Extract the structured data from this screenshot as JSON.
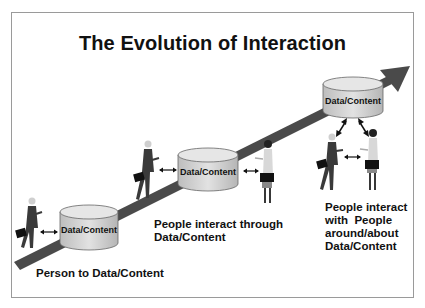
{
  "slide": {
    "title": "The Evolution of Interaction",
    "stages": [
      {
        "cylinder_label": "Data/Content",
        "caption_lines": [
          "Person to Data/Content"
        ]
      },
      {
        "cylinder_label": "Data/Content",
        "caption_lines": [
          "People interact through",
          "Data/Content"
        ]
      },
      {
        "cylinder_label": "Data/Content",
        "caption_lines": [
          "People interact",
          "with  People",
          "around/about",
          "Data/Content"
        ]
      }
    ],
    "icons": [
      "rising-arrow-icon",
      "database-cylinder-icon",
      "businessman-icon",
      "businesswoman-icon",
      "double-arrow-icon"
    ],
    "colors": {
      "arrow": "#4a4a4a",
      "cylinder_fill": "#d4d4d4",
      "cylinder_top": "#e4e4e4",
      "cylinder_stroke": "#555555",
      "text": "#111111",
      "frame_border": "#9a9a9a"
    }
  }
}
